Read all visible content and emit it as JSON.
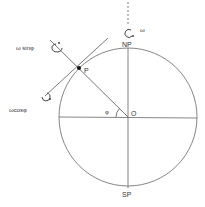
{
  "diagram": {
    "labels": {
      "north_pole": "NP",
      "south_pole": "SP",
      "point": "P",
      "center": "O",
      "angle": "φ",
      "omega": "ω",
      "omega_sin": "ω sinφ",
      "omega_cos": "ωcosφ"
    },
    "colors": {
      "line": "#555555",
      "text": "#333333",
      "background": "#ffffff"
    }
  }
}
